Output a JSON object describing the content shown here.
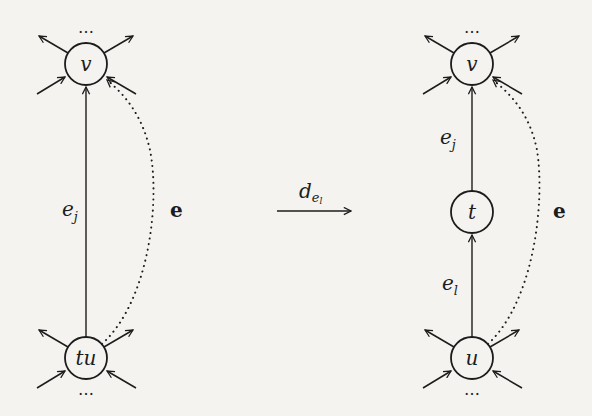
{
  "diagram": {
    "type": "graph-transformation",
    "stroke_color": "#1c1c1c",
    "background_color": "#f4f3f0",
    "left_graph": {
      "nodes": [
        {
          "id": "v",
          "label": "v",
          "cx": 86,
          "cy": 64,
          "r": 21,
          "ellipsis": "…",
          "ellipsis_position": "above"
        },
        {
          "id": "tu",
          "label": "tu",
          "cx": 86,
          "cy": 358,
          "r": 21,
          "ellipsis": "…",
          "ellipsis_position": "below"
        }
      ],
      "edges": [
        {
          "id": "e_j",
          "from": "tu",
          "to": "v",
          "style": "solid",
          "directed": true,
          "label": "e",
          "label_sub": "j"
        },
        {
          "id": "e",
          "from": "tu",
          "to": "v",
          "style": "dotted",
          "directed": true,
          "curved": true,
          "label": "e"
        }
      ]
    },
    "transformation": {
      "label": "d",
      "label_sub": "e",
      "label_subsub": "l"
    },
    "right_graph": {
      "nodes": [
        {
          "id": "v",
          "label": "v",
          "cx": 472,
          "cy": 64,
          "r": 21,
          "ellipsis": "…",
          "ellipsis_position": "above"
        },
        {
          "id": "t",
          "label": "t",
          "cx": 472,
          "cy": 212,
          "r": 21
        },
        {
          "id": "u",
          "label": "u",
          "cx": 472,
          "cy": 358,
          "r": 21,
          "ellipsis": "…",
          "ellipsis_position": "below"
        }
      ],
      "edges": [
        {
          "id": "e_j",
          "from": "t",
          "to": "v",
          "style": "solid",
          "directed": true,
          "label": "e",
          "label_sub": "j"
        },
        {
          "id": "e_l",
          "from": "u",
          "to": "t",
          "style": "solid",
          "directed": true,
          "label": "e",
          "label_sub": "l"
        },
        {
          "id": "e",
          "from": "u",
          "to": "v",
          "style": "dotted",
          "directed": true,
          "curved": true,
          "label": "e"
        }
      ]
    }
  }
}
